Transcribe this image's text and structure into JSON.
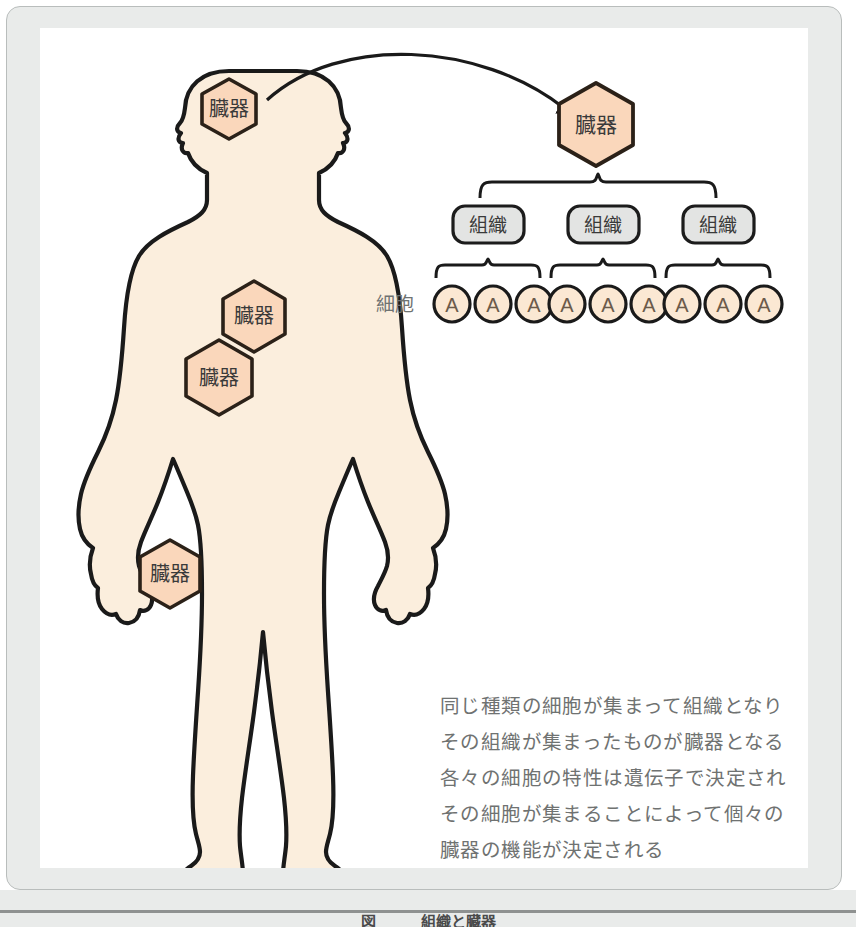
{
  "figure": {
    "caption": "図　　　組織と臓器",
    "background_color": "#ffffff",
    "mat_color": "#e9ebea",
    "frame_border_color": "#b9bdbc"
  },
  "colors": {
    "skin_fill": "#fbeedd",
    "organ_fill": "#fad7bb",
    "cell_fill": "#fbe8d3",
    "tissue_fill": "#e3e4e3",
    "outline": "#1a1a1a",
    "text_dark": "#3a3a3a",
    "text_gray": "#6f7271"
  },
  "body_figure": {
    "name": "human-body-silhouette",
    "organs": [
      {
        "id": "head-organ",
        "label": "臓器",
        "cx": 189,
        "cy": 89,
        "rx": 38,
        "ry": 38,
        "font_size": 20
      },
      {
        "id": "chest-organ",
        "label": "臓器",
        "cx": 214,
        "cy": 288,
        "rx": 37,
        "ry": 35,
        "font_size": 20
      },
      {
        "id": "abdomen-organ",
        "label": "臓器",
        "cx": 179,
        "cy": 349,
        "rx": 39,
        "ry": 37,
        "font_size": 20
      },
      {
        "id": "leg-organ",
        "label": "臓器",
        "cx": 130,
        "cy": 546,
        "rx": 35,
        "ry": 34,
        "font_size": 20
      }
    ]
  },
  "hierarchy": {
    "organ_node": {
      "label": "臓器",
      "cx": 556,
      "cy": 96,
      "r": 42,
      "font_size": 21
    },
    "arrow": {
      "name": "organ-zoom-arrow",
      "from": [
        225,
        70
      ],
      "to": [
        522,
        92
      ]
    },
    "tissue_label_row": {
      "boxes": [
        {
          "label": "組織",
          "cx": 448,
          "cy": 196
        },
        {
          "label": "組織",
          "cx": 563,
          "cy": 196
        },
        {
          "label": "組織",
          "cx": 678,
          "cy": 196
        }
      ]
    },
    "cell_row": {
      "row_label": "細胞",
      "row_label_x": 355,
      "cell_label": "A",
      "groups": [
        {
          "cells": [
            {
              "cx": 412
            },
            {
              "cx": 453
            },
            {
              "cx": 494
            }
          ]
        },
        {
          "cells": [
            {
              "cx": 527
            },
            {
              "cx": 568
            },
            {
              "cx": 609
            }
          ]
        },
        {
          "cells": [
            {
              "cx": 642
            },
            {
              "cx": 683
            },
            {
              "cx": 724
            }
          ]
        }
      ],
      "cell_r": 18,
      "cell_cy": 276
    },
    "braces": {
      "organ_to_tissue": {
        "x1": 437,
        "x2": 679,
        "y": 155
      },
      "tissue_to_cells": [
        {
          "x1": 394,
          "x2": 497
        },
        {
          "x1": 509,
          "x2": 612
        },
        {
          "x1": 624,
          "x2": 727
        }
      ],
      "tissue_to_cells_y": 238
    }
  },
  "description": {
    "lines": [
      "同じ種類の細胞が集まって組織となり",
      "その組織が集まったものが臓器となる",
      "各々の細胞の特性は遺伝子で決定され",
      "その細胞が集まることによって個々の",
      "臓器の機能が決定される"
    ]
  }
}
